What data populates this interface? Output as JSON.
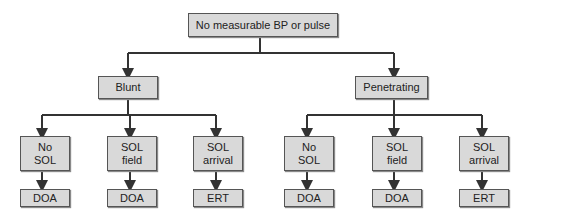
{
  "diagram": {
    "type": "flowchart",
    "root": {
      "label": "No measurable BP or pulse"
    },
    "branches": [
      {
        "label": "Blunt",
        "children": [
          {
            "line1": "No",
            "line2": "SOL",
            "outcome": "DOA"
          },
          {
            "line1": "SOL",
            "line2": "field",
            "outcome": "DOA"
          },
          {
            "line1": "SOL",
            "line2": "arrival",
            "outcome": "ERT"
          }
        ]
      },
      {
        "label": "Penetrating",
        "children": [
          {
            "line1": "No",
            "line2": "SOL",
            "outcome": "DOA"
          },
          {
            "line1": "SOL",
            "line2": "field",
            "outcome": "DOA"
          },
          {
            "line1": "SOL",
            "line2": "arrival",
            "outcome": "ERT"
          }
        ]
      }
    ],
    "colors": {
      "box_fill": "#d9d9d9",
      "box_border": "#555555",
      "line": "#333333"
    }
  }
}
